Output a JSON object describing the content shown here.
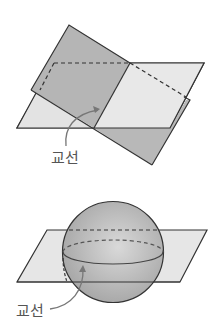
{
  "figure_top": {
    "description": "Two intersecting planes",
    "label": "교선"
  },
  "figure_bottom": {
    "description": "Sphere intersected by a plane",
    "label": "교선"
  },
  "colors": {
    "stroke": "#333333",
    "tilted_plane": "#b9b9b9",
    "horizontal_plane": "#e6e6e6",
    "overlap": "#a8a8a8",
    "sphere": "#b5b5b5",
    "arrow": "#777777"
  }
}
